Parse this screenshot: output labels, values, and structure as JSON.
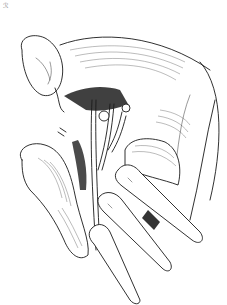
{
  "figure": {
    "type": "surgical line illustration",
    "style": "black ink on white",
    "corner_mark": "ℛ",
    "colors": {
      "ink": "#1a1a1a",
      "background": "#ffffff"
    },
    "elements": [
      "retracted-organ-upper-left",
      "abdominal-wall-fold-right",
      "vessels-and-ducts-center",
      "bowel-loop-left",
      "fingers-retracting-lower-right"
    ]
  }
}
